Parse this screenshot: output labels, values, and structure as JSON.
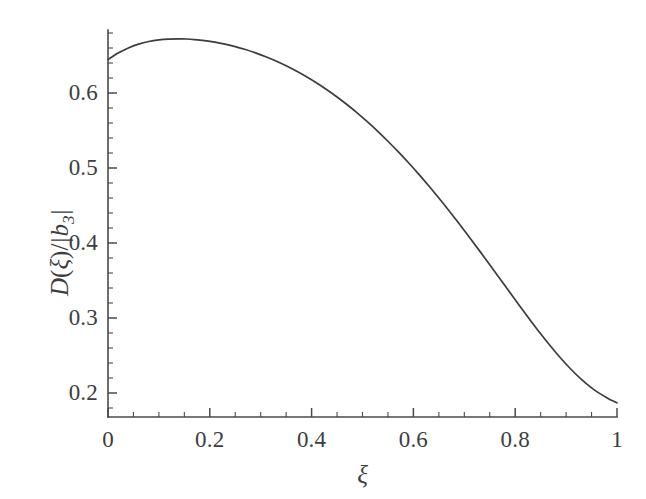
{
  "chart_data": {
    "type": "line",
    "title": "",
    "subtitle": "",
    "xlabel": "ξ",
    "ylabel": "D(ξ)/| b₃ |",
    "ylabel_parts": {
      "d": "D",
      "open_paren": "(",
      "xi": "ξ",
      "close_paren": ")",
      "slash": "/",
      "bar_left": "|",
      "b": "b",
      "sub": "3",
      "bar_right": "|"
    },
    "xlim": [
      0,
      1
    ],
    "ylim": [
      0.168,
      0.684
    ],
    "grid": false,
    "legend": null,
    "legend_position": "none",
    "x_ticks_major": [
      0,
      0.2,
      0.4,
      0.6,
      0.8,
      1
    ],
    "x_tick_labels": [
      "0",
      "0.2",
      "0.4",
      "0.6",
      "0.8",
      "1"
    ],
    "x_minor_step": 0.05,
    "y_ticks_major": [
      0.2,
      0.3,
      0.4,
      0.5,
      0.6
    ],
    "y_tick_labels": [
      "0.2",
      "0.3",
      "0.4",
      "0.5",
      "0.6"
    ],
    "y_minor_step": 0.02,
    "line_color": "#3c3c3c",
    "axis_color": "#4a4a4a",
    "background_color": "#ffffff",
    "series": [
      {
        "name": "D(ξ)/|b3|",
        "x": [
          0.0,
          0.02,
          0.04,
          0.06,
          0.08,
          0.1,
          0.12,
          0.14,
          0.16,
          0.18,
          0.2,
          0.22,
          0.24,
          0.26,
          0.28,
          0.3,
          0.32,
          0.34,
          0.36,
          0.38,
          0.4,
          0.42,
          0.44,
          0.46,
          0.48,
          0.5,
          0.52,
          0.54,
          0.56,
          0.58,
          0.6,
          0.62,
          0.64,
          0.66,
          0.68,
          0.7,
          0.72,
          0.74,
          0.76,
          0.78,
          0.8,
          0.82,
          0.84,
          0.86,
          0.88,
          0.9,
          0.92,
          0.94,
          0.96,
          0.98,
          1.0
        ],
        "y": [
          0.6445,
          0.653,
          0.6598,
          0.6647,
          0.6681,
          0.6703,
          0.6715,
          0.672,
          0.6718,
          0.6709,
          0.6694,
          0.6673,
          0.6646,
          0.6613,
          0.6575,
          0.6531,
          0.6481,
          0.6425,
          0.6363,
          0.6296,
          0.6223,
          0.6144,
          0.6059,
          0.5969,
          0.5873,
          0.4734,
          0.4734,
          0.4734,
          0.4734,
          0.4734,
          0.4734,
          0.4734,
          0.4734,
          0.4734,
          0.4734,
          0.4734,
          0.4734,
          0.4734,
          0.4734,
          0.4734,
          0.264,
          0.264,
          0.264,
          0.264,
          0.264,
          0.264,
          0.264,
          0.264,
          0.264,
          0.264,
          0.1853
        ]
      }
    ],
    "curve_points": [
      [
        0.0,
        0.6445
      ],
      [
        0.02,
        0.6532
      ],
      [
        0.04,
        0.6601
      ],
      [
        0.06,
        0.6652
      ],
      [
        0.08,
        0.6687
      ],
      [
        0.1,
        0.6708
      ],
      [
        0.12,
        0.6718
      ],
      [
        0.14,
        0.6721
      ],
      [
        0.155,
        0.672
      ],
      [
        0.17,
        0.6713
      ],
      [
        0.19,
        0.6699
      ],
      [
        0.21,
        0.6679
      ],
      [
        0.23,
        0.6652
      ],
      [
        0.25,
        0.6619
      ],
      [
        0.27,
        0.658
      ],
      [
        0.29,
        0.6535
      ],
      [
        0.31,
        0.6484
      ],
      [
        0.33,
        0.6427
      ],
      [
        0.35,
        0.6363
      ],
      [
        0.37,
        0.6293
      ],
      [
        0.39,
        0.6217
      ],
      [
        0.41,
        0.6134
      ],
      [
        0.43,
        0.6044
      ],
      [
        0.45,
        0.5947
      ],
      [
        0.47,
        0.5843
      ],
      [
        0.49,
        0.5732
      ],
      [
        0.51,
        0.5614
      ],
      [
        0.53,
        0.5489
      ],
      [
        0.55,
        0.5357
      ],
      [
        0.57,
        0.5218
      ],
      [
        0.59,
        0.5073
      ],
      [
        0.61,
        0.4921
      ],
      [
        0.63,
        0.4763
      ],
      [
        0.65,
        0.4599
      ],
      [
        0.67,
        0.443
      ],
      [
        0.69,
        0.4256
      ],
      [
        0.71,
        0.4077
      ],
      [
        0.73,
        0.3895
      ],
      [
        0.75,
        0.371
      ],
      [
        0.77,
        0.3524
      ],
      [
        0.79,
        0.3337
      ],
      [
        0.81,
        0.3151
      ],
      [
        0.83,
        0.2968
      ],
      [
        0.85,
        0.279
      ],
      [
        0.87,
        0.262
      ],
      [
        0.89,
        0.246
      ],
      [
        0.91,
        0.2313
      ],
      [
        0.93,
        0.2182
      ],
      [
        0.95,
        0.2069
      ],
      [
        0.965,
        0.1998
      ],
      [
        0.98,
        0.1936
      ],
      [
        0.99,
        0.19
      ],
      [
        1.0,
        0.187
      ]
    ],
    "annotations": [],
    "notable_values": {
      "start_value": 0.6445,
      "peak_x": 0.145,
      "peak_value": 0.6721,
      "end_value": 0.187,
      "value_at_0_5": 0.5675,
      "value_at_0_8": 0.3244
    }
  },
  "axes_geometry": {
    "left_px": 108,
    "right_px": 617,
    "bottom_px": 417,
    "top_px": 30
  }
}
